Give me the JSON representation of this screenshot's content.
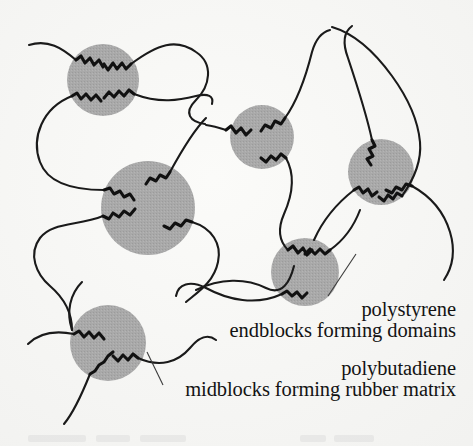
{
  "figure": {
    "kind": "diagram",
    "background_color": "#f8f8f6"
  },
  "labels": {
    "polystyrene": {
      "line1": "polystyrene",
      "line2": "endblocks forming domains",
      "color": "#131313"
    },
    "polybutadiene": {
      "line1": "polybutadiene",
      "line2": "midblocks forming rubber matrix",
      "color": "#131313"
    }
  },
  "legend_semantics": {
    "domain_shape": "gray-filled-circle",
    "endblock_shape": "zigzag-segment",
    "midblock_shape": "smooth-curve"
  },
  "style": {
    "domain_fill": "#a9a9a9",
    "domain_fill_dark": "#9d9d9d",
    "chain_stroke": "#1a1a1a",
    "chain_width": 2.1,
    "endblock_stroke": "#111111",
    "endblock_width": 3.1,
    "leader_stroke": "#3a3a3a",
    "leader_width": 1.1
  },
  "domains": [
    {
      "name": "domain-top-left",
      "cx": 103,
      "cy": 80,
      "r": 36
    },
    {
      "name": "domain-center-left",
      "cx": 148,
      "cy": 208,
      "r": 47
    },
    {
      "name": "domain-middle",
      "cx": 262,
      "cy": 137,
      "r": 32
    },
    {
      "name": "domain-right-upper",
      "cx": 381,
      "cy": 172,
      "r": 33
    },
    {
      "name": "domain-right-lower",
      "cx": 305,
      "cy": 272,
      "r": 34
    },
    {
      "name": "domain-bottom-left",
      "cx": 108,
      "cy": 343,
      "r": 38
    }
  ],
  "leaders": [
    {
      "name": "leader-polystyrene",
      "from_x": 328,
      "from_y": 296,
      "to_x": 355,
      "to_y": 255
    },
    {
      "name": "leader-polybutadiene",
      "from_x": 163,
      "from_y": 385,
      "to_x": 146,
      "to_y": 351
    }
  ]
}
